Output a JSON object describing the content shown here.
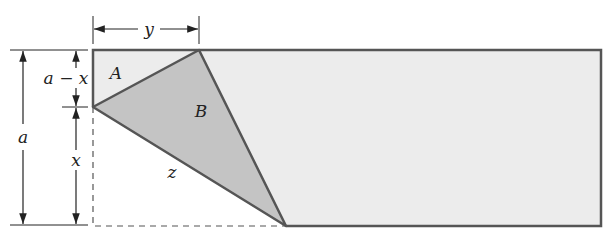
{
  "diagram": {
    "type": "folded-paper-geometry",
    "colors": {
      "paper_fill": "#ececec",
      "folded_flap_fill": "#c4c4c4",
      "outline": "#555555",
      "dimension_line": "#222222",
      "background": "#ffffff"
    },
    "labels": {
      "top_dimension": "y",
      "left_outer_dimension": "a",
      "left_upper_dimension": "a − x",
      "left_lower_dimension": "x",
      "region_a": "A",
      "region_b": "B",
      "hypotenuse": "z"
    }
  }
}
